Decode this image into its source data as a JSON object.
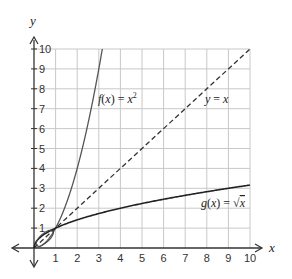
{
  "chart_data": {
    "type": "line",
    "title": "",
    "xlabel": "x",
    "ylabel": "y",
    "xlim": [
      0,
      10
    ],
    "ylim": [
      0,
      10
    ],
    "grid": true,
    "x_ticks": [
      "1",
      "2",
      "3",
      "4",
      "5",
      "6",
      "7",
      "8",
      "9",
      "10"
    ],
    "y_ticks": [
      "1",
      "2",
      "3",
      "4",
      "5",
      "6",
      "7",
      "8",
      "9",
      "10"
    ],
    "series": [
      {
        "name": "f(x) = x²",
        "style": "solid",
        "color": "#555555",
        "x": [
          0,
          0.5,
          1,
          1.5,
          2,
          2.5,
          3,
          3.16
        ],
        "y": [
          0,
          0.25,
          1,
          2.25,
          4,
          6.25,
          9,
          10
        ]
      },
      {
        "name": "y = x",
        "style": "dashed",
        "color": "#333333",
        "x": [
          0,
          1,
          2,
          3,
          4,
          5,
          6,
          7,
          8,
          9,
          10
        ],
        "y": [
          0,
          1,
          2,
          3,
          4,
          5,
          6,
          7,
          8,
          9,
          10
        ]
      },
      {
        "name": "g(x) = √x",
        "style": "solid",
        "color": "#222222",
        "x": [
          0,
          0.25,
          1,
          2,
          3,
          4,
          5,
          6,
          7,
          8,
          9,
          10
        ],
        "y": [
          0,
          0.5,
          1,
          1.41,
          1.73,
          2,
          2.24,
          2.45,
          2.65,
          2.83,
          3,
          3.16
        ]
      }
    ],
    "annotations": [
      {
        "text_parts": [
          "f",
          "(",
          "x",
          ") = ",
          "x",
          "2"
        ],
        "at": [
          3.1,
          7.2
        ]
      },
      {
        "text_parts": [
          "y",
          " = ",
          "x"
        ],
        "at": [
          7.2,
          7.2
        ]
      },
      {
        "text_parts": [
          "g",
          "(",
          "x",
          ") = √",
          "x"
        ],
        "at": [
          7.7,
          2.0
        ]
      }
    ]
  },
  "labels": {
    "x_axis": "x",
    "y_axis": "y",
    "f_name": "f",
    "f_open": "(",
    "f_var": "x",
    "f_eq": ") = ",
    "f_base": "x",
    "f_exp": "2",
    "yx_y": "y",
    "yx_eq": " = ",
    "yx_x": "x",
    "g_name": "g",
    "g_open": "(",
    "g_var": "x",
    "g_eq": ") = ",
    "g_sqrt": "√",
    "g_arg": "x"
  }
}
